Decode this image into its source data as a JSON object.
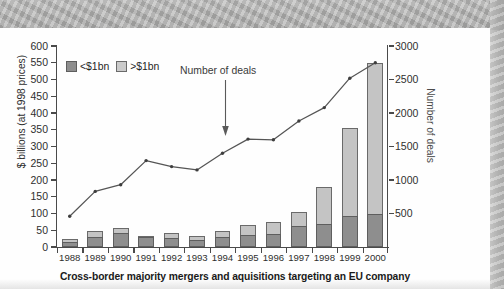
{
  "caption": "Cross-border majority mergers and aquisitions targeting an EU company",
  "legend": {
    "items": [
      {
        "label": "<$1bn",
        "color": "#8e8e8e",
        "swatch": "small-deals-swatch"
      },
      {
        "label": ">$1bn",
        "color": "#cbcbcb",
        "swatch": "large-deals-swatch"
      }
    ]
  },
  "annotation": {
    "text": "Number of deals"
  },
  "axes": {
    "left": {
      "title": "$ billions (at 1998 prices)",
      "ticks": [
        0,
        50,
        100,
        150,
        200,
        250,
        300,
        350,
        400,
        450,
        500,
        550,
        600
      ],
      "min": 0,
      "max": 600
    },
    "right": {
      "title": "Number of deals",
      "ticks": [
        500,
        1000,
        1500,
        2000,
        2500,
        3000
      ],
      "min": 0,
      "max": 3000
    },
    "x": {
      "ticks": [
        "1988",
        "1989",
        "1990",
        "1991",
        "1992",
        "1993",
        "1994",
        "1995",
        "1996",
        "1997",
        "1998",
        "1999",
        "2000"
      ]
    }
  },
  "chart_data": {
    "type": "bar",
    "title": "Cross-border majority mergers and aquisitions targeting an EU company",
    "xlabel": "",
    "ylabel": "$ billions (at 1998 prices)",
    "y2label": "Number of deals",
    "ylim": [
      0,
      600
    ],
    "y2lim": [
      0,
      3000
    ],
    "grid": false,
    "legend_position": "top-left",
    "categories": [
      "1988",
      "1989",
      "1990",
      "1991",
      "1992",
      "1993",
      "1994",
      "1995",
      "1996",
      "1997",
      "1998",
      "1999",
      "2000"
    ],
    "series": [
      {
        "name": "<$1bn",
        "type": "bar",
        "stack": "value",
        "axis": "left",
        "unit": "$ billions (at 1998 prices)",
        "color": "#8e8e8e",
        "values": [
          16,
          30,
          41,
          30,
          26,
          22,
          29,
          37,
          39,
          62,
          68,
          92,
          98
        ]
      },
      {
        "name": ">$1bn",
        "type": "bar",
        "stack": "value",
        "axis": "left",
        "unit": "$ billions (at 1998 prices)",
        "color": "#c4c4c4",
        "values": [
          9,
          17,
          17,
          3,
          15,
          12,
          18,
          29,
          35,
          42,
          110,
          262,
          452
        ]
      },
      {
        "name": "Number of deals",
        "type": "line",
        "axis": "right",
        "unit": "deals",
        "color": "#555555",
        "values": [
          460,
          830,
          930,
          1290,
          1200,
          1150,
          1400,
          1610,
          1600,
          1880,
          2080,
          2520,
          2750
        ]
      }
    ],
    "totals_left_axis": [
      25,
      47,
      58,
      33,
      41,
      34,
      47,
      66,
      74,
      104,
      178,
      354,
      550
    ]
  }
}
